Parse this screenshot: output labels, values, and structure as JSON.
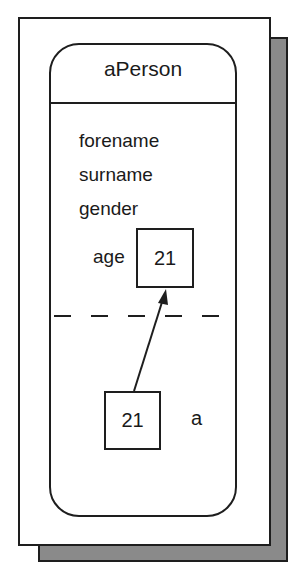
{
  "diagram": {
    "object": {
      "name": "aPerson",
      "attributes": [
        "forename",
        "surname",
        "gender"
      ],
      "age_attribute": {
        "label": "age",
        "value": "21"
      }
    },
    "local_variable": {
      "name": "a",
      "value": "21"
    },
    "arrow": {
      "from": "local_variable",
      "to": "age_attribute"
    },
    "colors": {
      "line": "#1e1e1e",
      "shadow": "#8a8a8a",
      "background": "#ffffff"
    }
  }
}
